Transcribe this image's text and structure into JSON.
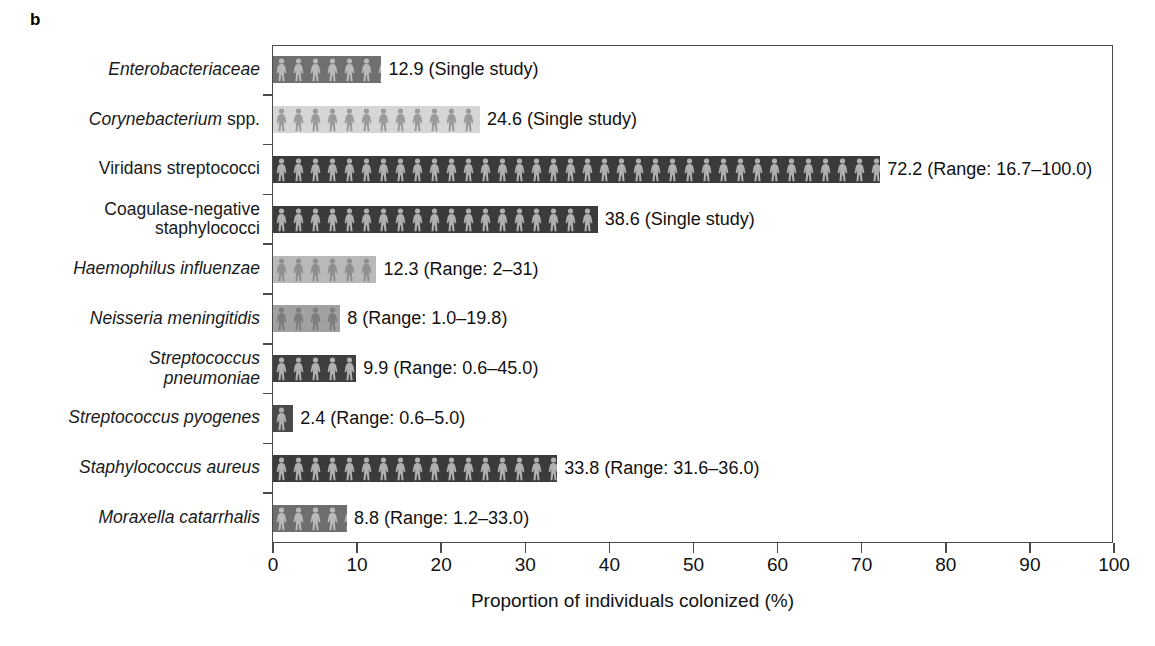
{
  "panel": {
    "letter": "b"
  },
  "chart_data": {
    "type": "bar",
    "orientation": "horizontal",
    "title": "",
    "xlabel": "Proportion of individuals colonized (%)",
    "ylabel": "",
    "xlim": [
      0,
      100
    ],
    "xticks": [
      0,
      10,
      20,
      30,
      40,
      50,
      60,
      70,
      80,
      90,
      100
    ],
    "xticklabels": [
      "0",
      "10",
      "20",
      "30",
      "40",
      "50",
      "60",
      "70",
      "80",
      "90",
      "100"
    ],
    "grid": false,
    "legend": false,
    "categories": [
      "Enterobacteriaceae",
      "Corynebacterium spp.",
      "Viridans streptococci",
      "Coagulase-negative staphylococci",
      "Haemophilus influenzae",
      "Neisseria meningitidis",
      "Streptococcus pneumoniae",
      "Streptococcus pyogenes",
      "Staphylococcus aureus",
      "Moraxella catarrhalis"
    ],
    "values": [
      12.9,
      24.6,
      72.2,
      38.6,
      12.3,
      8,
      9.9,
      2.4,
      33.8,
      8.8
    ],
    "annotations": [
      "12.9 (Single study)",
      "24.6 (Single study)",
      "72.2 (Range: 16.7–100.0)",
      "38.6 (Single study)",
      "12.3 (Range: 2–31)",
      "8 (Range: 1.0–19.8)",
      "9.9 (Range: 0.6–45.0)",
      "2.4 (Range: 0.6–5.0)",
      "33.8 (Range: 31.6–36.0)",
      "8.8 (Range: 1.2–33.0)"
    ],
    "bar_colors": [
      "#707070",
      "#d6d6d6",
      "#3b3b3b",
      "#3b3b3b",
      "#b9b9b9",
      "#a1a1a1",
      "#3f3f3f",
      "#4a4a4a",
      "#3b3b3b",
      "#6e6e6e"
    ],
    "figure_colors": [
      "#b9b9b9",
      "#9a9a9a",
      "#b0b0b0",
      "#b0b0b0",
      "#8e8e8e",
      "#7d7d7d",
      "#b0b0b0",
      "#b0b0b0",
      "#b0b0b0",
      "#b9b9b9"
    ]
  },
  "rows": [
    {
      "label_html": "Enterobacteriaceae",
      "label_plain": "Enterobacteriaceae",
      "style": "italic",
      "value": 12.9,
      "annotation": "12.9 (Single study)"
    },
    {
      "label_html": "Corynebacterium spp.",
      "label_plain": "Corynebacterium spp.",
      "style": "italic-partial",
      "italic_part": "Corynebacterium",
      "roman_part": " spp.",
      "value": 24.6,
      "annotation": "24.6 (Single study)"
    },
    {
      "label_html": "Viridans streptococci",
      "label_plain": "Viridans streptococci",
      "style": "roman",
      "value": 72.2,
      "annotation": "72.2 (Range: 16.7–100.0)"
    },
    {
      "label_html": "Coagulase-negative\nstaphylococci",
      "label_plain": "Coagulase-negative staphylococci",
      "style": "roman",
      "value": 38.6,
      "annotation": "38.6 (Single study)"
    },
    {
      "label_html": "Haemophilus influenzae",
      "label_plain": "Haemophilus influenzae",
      "style": "italic",
      "value": 12.3,
      "annotation": "12.3 (Range: 2–31)"
    },
    {
      "label_html": "Neisseria meningitidis",
      "label_plain": "Neisseria meningitidis",
      "style": "italic",
      "value": 8,
      "annotation": "8 (Range: 1.0–19.8)"
    },
    {
      "label_html": "Streptococcus\npneumoniae",
      "label_plain": "Streptococcus pneumoniae",
      "style": "italic",
      "value": 9.9,
      "annotation": "9.9 (Range: 0.6–45.0)"
    },
    {
      "label_html": "Streptococcus pyogenes",
      "label_plain": "Streptococcus pyogenes",
      "style": "italic",
      "value": 2.4,
      "annotation": "2.4 (Range: 0.6–5.0)"
    },
    {
      "label_html": "Staphylococcus aureus",
      "label_plain": "Staphylococcus aureus",
      "style": "italic",
      "value": 33.8,
      "annotation": "33.8 (Range: 31.6–36.0)"
    },
    {
      "label_html": "Moraxella catarrhalis",
      "label_plain": "Moraxella catarrhalis",
      "style": "italic",
      "value": 8.8,
      "annotation": "8.8 (Range: 1.2–33.0)"
    }
  ],
  "axis": {
    "xlabel": "Proportion of individuals colonized (%)",
    "ticklabels": [
      "0",
      "10",
      "20",
      "30",
      "40",
      "50",
      "60",
      "70",
      "80",
      "90",
      "100"
    ],
    "axis_color": "#4a4a4a"
  }
}
